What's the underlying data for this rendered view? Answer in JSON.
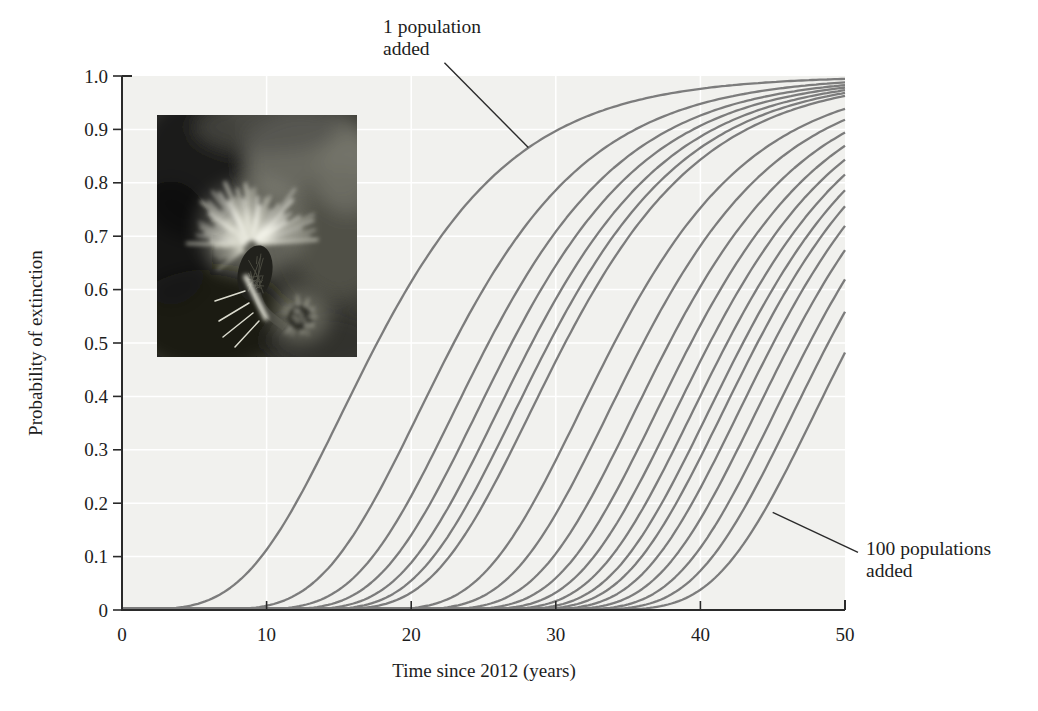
{
  "figure": {
    "photo": {
      "subject": "Thistle flower head, grayscale inset photograph"
    }
  },
  "chart_data": {
    "type": "line",
    "title": "",
    "xlabel": "Time since 2012 (years)",
    "ylabel": "Probability of extinction",
    "xlim": [
      0,
      50
    ],
    "ylim": [
      0,
      1.0
    ],
    "grid": true,
    "legend": "none",
    "plot_background": "#f1f1ee",
    "xticks": {
      "values": [
        0,
        10,
        20,
        30,
        40,
        50
      ],
      "labels": [
        "0",
        "10",
        "20",
        "30",
        "40",
        "50"
      ]
    },
    "yticks": {
      "values": [
        0,
        0.1,
        0.2,
        0.3,
        0.4,
        0.5,
        0.6,
        0.7,
        0.8,
        0.9,
        1.0
      ],
      "labels": [
        "0",
        "0.1",
        "0.2",
        "0.3",
        "0.4",
        "0.5",
        "0.6",
        "0.7",
        "0.8",
        "0.9",
        "1.0"
      ]
    },
    "model": "gompertz: p(t) = exp(-exp(-k*(t - x0)))",
    "k": 0.15,
    "series": [
      {
        "name": "1 population added",
        "x0": 15.2,
        "midpoint_year": 17.6,
        "p_at_50": 0.99
      },
      {
        "name": "",
        "x0": 20.5,
        "midpoint_year": 22.9
      },
      {
        "name": "",
        "x0": 22.9,
        "midpoint_year": 25.3
      },
      {
        "name": "",
        "x0": 24.5,
        "midpoint_year": 26.9
      },
      {
        "name": "",
        "x0": 25.9,
        "midpoint_year": 28.3
      },
      {
        "name": "",
        "x0": 27.1,
        "midpoint_year": 29.5
      },
      {
        "name": "",
        "x0": 28.2,
        "midpoint_year": 30.6
      },
      {
        "name": "",
        "x0": 31.6,
        "midpoint_year": 34.0
      },
      {
        "name": "",
        "x0": 33.6,
        "midpoint_year": 36.0
      },
      {
        "name": "",
        "x0": 35.4,
        "midpoint_year": 37.8
      },
      {
        "name": "",
        "x0": 36.9,
        "midpoint_year": 39.3
      },
      {
        "name": "",
        "x0": 38.2,
        "midpoint_year": 40.6
      },
      {
        "name": "",
        "x0": 39.4,
        "midpoint_year": 41.8
      },
      {
        "name": "",
        "x0": 40.5,
        "midpoint_year": 42.9
      },
      {
        "name": "",
        "x0": 41.5,
        "midpoint_year": 43.9
      },
      {
        "name": "",
        "x0": 42.6,
        "midpoint_year": 45.0
      },
      {
        "name": "",
        "x0": 43.8,
        "midpoint_year": 46.2
      },
      {
        "name": "",
        "x0": 45.1,
        "midpoint_year": 47.5
      },
      {
        "name": "",
        "x0": 46.4,
        "midpoint_year": 48.8
      },
      {
        "name": "100 populations added",
        "x0": 47.9,
        "midpoint_year": 50.3,
        "p_at_50": 0.48
      }
    ],
    "annotations": [
      {
        "line1": "1 population",
        "line2": "added",
        "pointer_from": [
          22.3,
          1.025
        ],
        "pointer_to": [
          28.1,
          0.866
        ]
      },
      {
        "line1": "100 populations",
        "line2": "added",
        "pointer_from": [
          50.9,
          0.108
        ],
        "pointer_to": [
          45.0,
          0.183
        ]
      }
    ],
    "colors": {
      "curve": "#7c7c7c",
      "axis": "#2a2a2a",
      "grid": "#ffffff",
      "text": "#1d1d1d"
    }
  }
}
